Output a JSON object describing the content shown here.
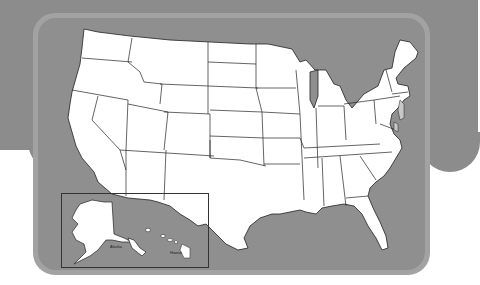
{
  "map": {
    "title": "",
    "subject": "Blank outline map of the United States",
    "inset": {
      "alaska_label": "Alaska",
      "hawaii_label": "Hawaii"
    },
    "colors": {
      "background_band": "#8c8c8c",
      "card_border": "#a2a2a2",
      "card_fill": "#8f8f8f",
      "land_fill": "#ffffff",
      "state_border": "#222222",
      "highlight_states": "#c8c8c8"
    }
  }
}
